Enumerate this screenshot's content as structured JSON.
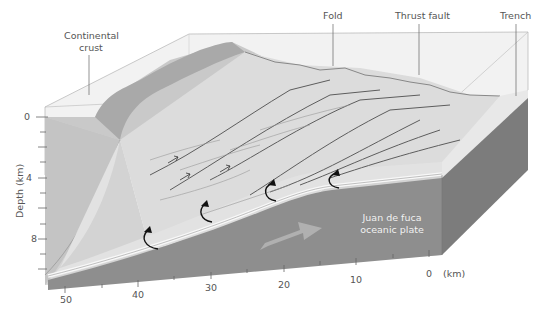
{
  "diagram": {
    "labels": {
      "continental_crust": [
        "Continental",
        "crust"
      ],
      "fold": "Fold",
      "thrust_fault": "Thrust fault",
      "trench": "Trench",
      "plate": [
        "Juan de fuca",
        "oceanic plate"
      ]
    },
    "depth_axis": {
      "title": "Depth (km)",
      "ticks": [
        "0",
        "4",
        "8"
      ]
    },
    "distance_axis": {
      "unit": "(km)",
      "ticks": [
        "50",
        "40",
        "30",
        "20",
        "10",
        "0"
      ]
    },
    "colors": {
      "block_face": "#d6d6d6",
      "sediment": "#e3e3e3",
      "plate": "#8e8e8e",
      "plate_side": "#7a7a7a",
      "top_glass": "#efefef",
      "arrow": "#1a1a1a",
      "fault_line": "#5a5a5a"
    }
  }
}
